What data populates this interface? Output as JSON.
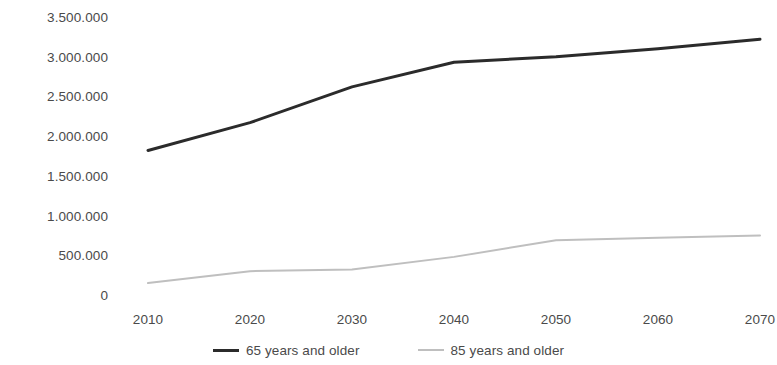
{
  "chart_data": {
    "type": "line",
    "title": "",
    "subtitle": "",
    "xlabel": "",
    "ylabel": "",
    "categories": [
      "2010",
      "2020",
      "2030",
      "2040",
      "2050",
      "2060",
      "2070"
    ],
    "x": [
      2010,
      2020,
      2030,
      2040,
      2050,
      2060,
      2070
    ],
    "xlim": [
      2010,
      2070
    ],
    "ylim": [
      0,
      3500000
    ],
    "y_ticks": [
      0,
      500000,
      1000000,
      1500000,
      2000000,
      2500000,
      3000000,
      3500000
    ],
    "y_tick_labels": [
      "0",
      "500.000",
      "1.000.000",
      "1.500.000",
      "2.000.000",
      "2.500.000",
      "3.000.000",
      "3.500.000"
    ],
    "x_tick_labels": [
      "2010",
      "2020",
      "2030",
      "2040",
      "2050",
      "2060",
      "2070"
    ],
    "grid": false,
    "legend_position": "bottom",
    "series": [
      {
        "name": "65 years and older",
        "color": "#2b2b2b",
        "line_width": 3,
        "values": [
          1820000,
          2170000,
          2620000,
          2930000,
          3000000,
          3100000,
          3220000
        ]
      },
      {
        "name": "85 years and older",
        "color": "#bfbfbf",
        "line_width": 2,
        "values": [
          150000,
          300000,
          320000,
          480000,
          690000,
          720000,
          750000
        ]
      }
    ]
  },
  "legend": {
    "entries": [
      {
        "label": "65 years and older"
      },
      {
        "label": "85 years and older"
      }
    ]
  },
  "colors": {
    "series_65_plus": "#2b2b2b",
    "series_85_plus": "#bfbfbf",
    "tick_text": "#4a4a4a",
    "background": "#ffffff"
  }
}
